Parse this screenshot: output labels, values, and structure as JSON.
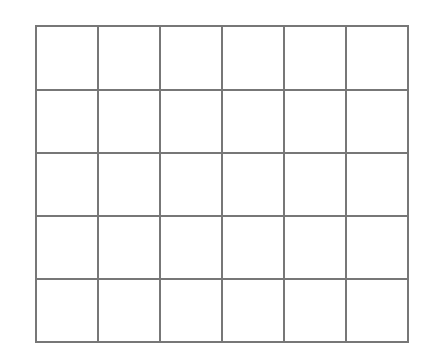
{
  "diagram": {
    "type": "grid",
    "rows": 5,
    "columns": 6,
    "line_color": "#777777",
    "background_color": "#ffffff",
    "line_width": 2,
    "x_lines": [
      36,
      98,
      160,
      222,
      284,
      346,
      408
    ],
    "y_lines": [
      26,
      90,
      153,
      216,
      279,
      342
    ]
  }
}
